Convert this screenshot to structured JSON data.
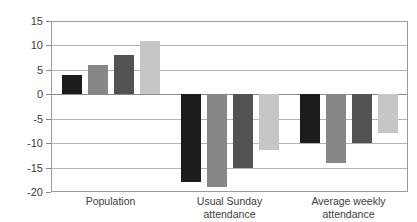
{
  "top_caption": "",
  "chart_data": {
    "type": "bar",
    "title": "",
    "subtitle": "",
    "xlabel": "",
    "ylabel": "",
    "ylim": [
      -20,
      15
    ],
    "ytick_values": [
      15,
      10,
      5,
      0,
      -5,
      -10,
      -15,
      -20
    ],
    "ytick_labels": [
      "15",
      "10",
      "5",
      "0",
      "-5",
      "-10",
      "-15",
      "-20"
    ],
    "grid": true,
    "grid_axis": "y",
    "legend": false,
    "legend_position": "none",
    "zero_line": true,
    "categories": [
      "Population",
      "Usual Sunday attendance",
      "Average weekly attendance"
    ],
    "category_lines": [
      [
        "Population"
      ],
      [
        "Usual Sunday",
        "attendance"
      ],
      [
        "Average weekly",
        "attendance"
      ]
    ],
    "series": [
      {
        "name": "Series 1",
        "color": "#1c1c1c",
        "values": [
          4,
          -18,
          -10
        ]
      },
      {
        "name": "Series 2",
        "color": "#878787",
        "values": [
          6,
          -19,
          -14
        ]
      },
      {
        "name": "Series 3",
        "color": "#525252",
        "values": [
          8,
          -15,
          -10
        ]
      },
      {
        "name": "Series 4",
        "color": "#c6c6c6",
        "values": [
          11,
          -11.5,
          -8
        ]
      }
    ]
  }
}
